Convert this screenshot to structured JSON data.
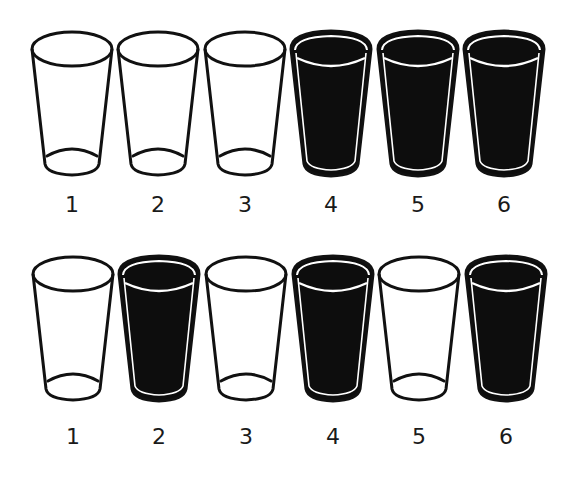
{
  "rows": [
    {
      "name": "top-row",
      "glasses": [
        {
          "label": "1",
          "state": "empty",
          "cx": 72
        },
        {
          "label": "2",
          "state": "empty",
          "cx": 158
        },
        {
          "label": "3",
          "state": "empty",
          "cx": 245
        },
        {
          "label": "4",
          "state": "full",
          "cx": 331
        },
        {
          "label": "5",
          "state": "full",
          "cx": 418
        },
        {
          "label": "6",
          "state": "full",
          "cx": 504
        }
      ],
      "glass_top": 28,
      "label_y": 193
    },
    {
      "name": "bottom-row",
      "glasses": [
        {
          "label": "1",
          "state": "empty",
          "cx": 73
        },
        {
          "label": "2",
          "state": "full",
          "cx": 159
        },
        {
          "label": "3",
          "state": "empty",
          "cx": 246
        },
        {
          "label": "4",
          "state": "full",
          "cx": 333
        },
        {
          "label": "5",
          "state": "empty",
          "cx": 419
        },
        {
          "label": "6",
          "state": "full",
          "cx": 506
        }
      ],
      "glass_top": 253,
      "label_y": 425
    }
  ],
  "colors": {
    "outline": "#111111",
    "liquid": "#0d0d0d",
    "background": "#ffffff",
    "highlight": "#ffffff"
  }
}
